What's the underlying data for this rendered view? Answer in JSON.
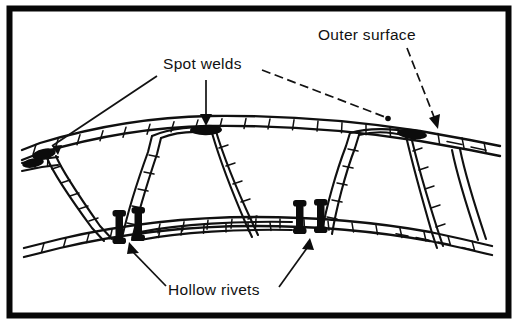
{
  "figure": {
    "background_color": "#ffffff",
    "ink_color": "#101010",
    "frame": {
      "name": "black-rectangular-border",
      "stroke_color": "#070707",
      "thickness_px": 6
    }
  },
  "labels": {
    "outer_surface": "Outer surface",
    "spot_welds": "Spot welds",
    "hollow_rivets": "Hollow rivets"
  },
  "annotations": [
    {
      "id": "outer-surface",
      "text": "Outer surface",
      "text_x": 318,
      "text_y": 40,
      "leader_style": "dashed",
      "arrowhead": "solid-triangle",
      "points_to": "top outer skin, right side"
    },
    {
      "id": "spot-welds",
      "text": "Spot welds",
      "text_x": 163,
      "text_y": 69,
      "leader_style": "solid-and-dashed",
      "arrowhead": "solid-triangle",
      "points_to": "three weld nuggets on underside of top skin"
    },
    {
      "id": "hollow-rivets",
      "text": "Hollow rivets",
      "text_x": 142,
      "text_y": 295,
      "leader_style": "solid",
      "arrowhead": "solid-triangle",
      "points_to": "four rivet heads on inner skin"
    }
  ],
  "callout_targets": {
    "spot_weld_count": 3,
    "hollow_rivet_count": 4,
    "skins": [
      "outer skin",
      "inner skin"
    ],
    "core": "corrugated trapezoidal truss core"
  }
}
